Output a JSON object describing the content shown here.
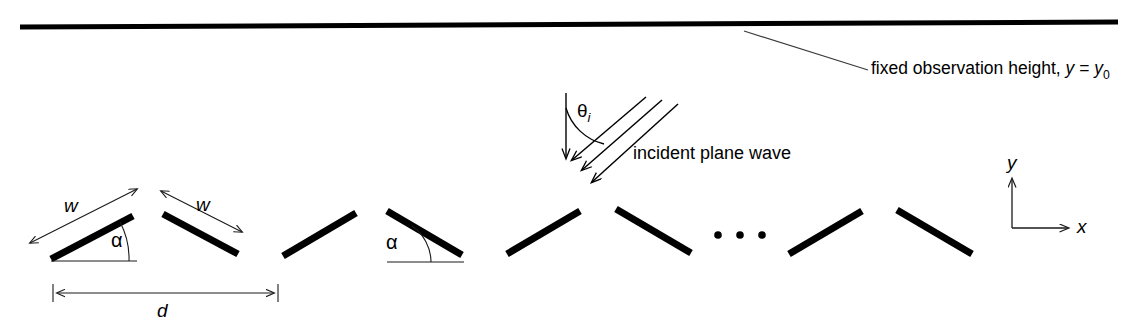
{
  "figure": {
    "background_color": "#ffffff",
    "stroke_color": "#000000",
    "thin_stroke_color": "#1a1a1a",
    "width": 1133,
    "height": 333
  },
  "labels": {
    "observation_height": "fixed observation height, ",
    "observation_height_math_y": "y",
    "observation_height_equals": " = ",
    "observation_height_y0_base": "y",
    "observation_height_y0_sub": "0",
    "incident_wave": "incident plane wave",
    "theta_base": "θ",
    "theta_sub": "i",
    "width_1": "w",
    "width_2": "w",
    "alpha_1": "α",
    "alpha_2": "α",
    "period": "d",
    "axis_y": "y",
    "axis_x": "x"
  },
  "geometry": {
    "observation_line": {
      "x1": 20,
      "y1": 27,
      "x2": 1118,
      "y2": 22,
      "stroke_width": 5
    },
    "leader_line": {
      "x1": 744,
      "y1": 31,
      "x2": 868,
      "y2": 70,
      "stroke_width": 1.2
    },
    "incidence_normal": {
      "x1": 566,
      "y1": 93,
      "x2": 566,
      "y2": 160,
      "stroke_width": 1.4
    },
    "incidence_arc": {
      "cx": 566,
      "cy": 160,
      "radius": 52,
      "start_deg": 270,
      "end_deg": 318
    },
    "incident_rays": [
      {
        "x1": 646,
        "y1": 97,
        "x2": 570,
        "y2": 162
      },
      {
        "x1": 662,
        "y1": 100,
        "x2": 580,
        "y2": 172
      },
      {
        "x1": 678,
        "y1": 104,
        "x2": 590,
        "y2": 184
      }
    ],
    "plates": [
      {
        "index": 1,
        "x1": 51,
        "y1": 259,
        "x2": 133,
        "y2": 216,
        "tilt": "up"
      },
      {
        "index": 2,
        "x1": 163,
        "y1": 214,
        "x2": 238,
        "y2": 254,
        "tilt": "down"
      },
      {
        "index": 3,
        "x1": 283,
        "y1": 256,
        "x2": 356,
        "y2": 213,
        "tilt": "up"
      },
      {
        "index": 4,
        "x1": 387,
        "y1": 211,
        "x2": 462,
        "y2": 255,
        "tilt": "down"
      },
      {
        "index": 5,
        "x1": 507,
        "y1": 254,
        "x2": 580,
        "y2": 211,
        "tilt": "up"
      },
      {
        "index": 6,
        "x1": 616,
        "y1": 209,
        "x2": 691,
        "y2": 253,
        "tilt": "down"
      },
      {
        "index": 7,
        "x1": 789,
        "y1": 254,
        "x2": 862,
        "y2": 211,
        "tilt": "up"
      },
      {
        "index": 8,
        "x1": 897,
        "y1": 210,
        "x2": 972,
        "y2": 254,
        "tilt": "down"
      }
    ],
    "plate_stroke_width": 7,
    "ellipsis_dots": [
      {
        "cx": 718,
        "cy": 235,
        "r": 3.8
      },
      {
        "cx": 740,
        "cy": 235,
        "r": 3.8
      },
      {
        "cx": 762,
        "cy": 235,
        "r": 3.8
      }
    ],
    "width_dim_1": {
      "x1": 26,
      "y1": 245,
      "x2": 140,
      "y2": 187
    },
    "width_dim_2": {
      "x1": 159,
      "y1": 190,
      "x2": 244,
      "y2": 233
    },
    "alpha_baseline_1": {
      "x1": 51,
      "y1": 261,
      "x2": 137,
      "y2": 261
    },
    "alpha_arc_1": {
      "cx": 51,
      "cy": 261,
      "radius": 78,
      "start_deg": 332,
      "end_deg": 360
    },
    "alpha_baseline_2": {
      "x1": 387,
      "y1": 262,
      "x2": 464,
      "y2": 262
    },
    "alpha_arc_2": {
      "cx": 387,
      "cy": 262,
      "radius": 44,
      "start_deg": 270,
      "end_deg": 330
    },
    "period_dim": {
      "x1": 53,
      "y1": 293,
      "x2": 278,
      "y2": 293
    },
    "axis_origin": {
      "x": 1012,
      "y": 228
    },
    "axis_y_tip": {
      "x": 1012,
      "y": 177
    },
    "axis_x_tip": {
      "x": 1070,
      "y": 228
    }
  }
}
